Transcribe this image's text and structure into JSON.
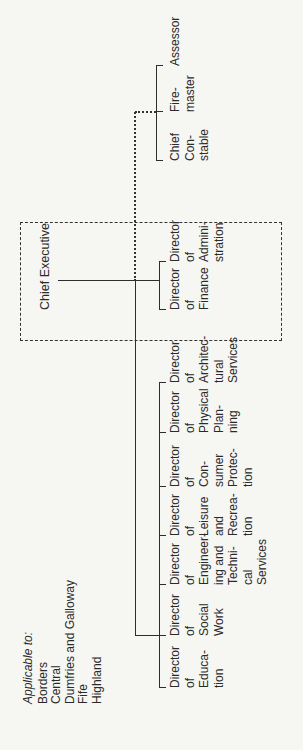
{
  "applicable": {
    "heading": "Applicable to:",
    "regions": [
      "Borders",
      "Central",
      "Dumfries and Galloway",
      "Fife",
      "Highland"
    ]
  },
  "chief_executive": {
    "label": "Chief Executive"
  },
  "box_directors": [
    {
      "lines": "Director\nof\nFinance"
    },
    {
      "lines": "Director\nof\nAdmini-\nstration"
    }
  ],
  "departments": [
    {
      "lines": "Director\nof\nEduca-\ntion"
    },
    {
      "lines": "Director\nof\nSocial\nWork"
    },
    {
      "lines": "Director\nof\nEngineer-\ning and\nTechni-\ncal\nServices"
    },
    {
      "lines": "Director\nof\nLeisure\nand\nRecrea-\ntion"
    },
    {
      "lines": "Director\nof\nCon-\nsumer\nProtec-\ntion"
    },
    {
      "lines": "Director\nof\nPhysical\nPlan-\nning"
    },
    {
      "lines": "Director\nof\nArchitec-\ntural\nServices"
    }
  ],
  "joint_services": [
    {
      "lines": "Chief\nCon-\nstable"
    },
    {
      "lines": "Fire-\nmaster"
    },
    {
      "lines": "Assessor"
    }
  ]
}
